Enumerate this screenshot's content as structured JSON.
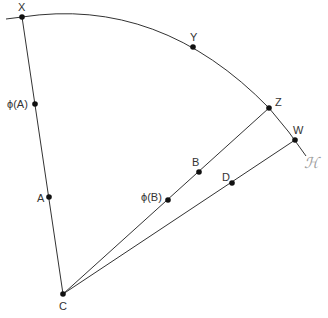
{
  "diagram": {
    "colors": {
      "line": "#333333",
      "point": "#111111",
      "label": "#333333",
      "script": "#9a9a9a"
    },
    "center": {
      "name": "C",
      "x": 63,
      "y": 294,
      "label": "C"
    },
    "arc": {
      "label": "ℋ",
      "description": "circular arc centered at C through X, Y, Z, W"
    },
    "points": [
      {
        "id": "X",
        "label": "X",
        "x": 22,
        "y": 17
      },
      {
        "id": "Y",
        "label": "Y",
        "x": 193,
        "y": 47
      },
      {
        "id": "Z",
        "label": "Z",
        "x": 269,
        "y": 108
      },
      {
        "id": "W",
        "label": "W",
        "x": 295,
        "y": 140
      },
      {
        "id": "phiA",
        "label": "ϕ(A)",
        "x": 35,
        "y": 104
      },
      {
        "id": "A",
        "label": "A",
        "x": 49,
        "y": 197
      },
      {
        "id": "B",
        "label": "B",
        "x": 199,
        "y": 172
      },
      {
        "id": "phiB",
        "label": "ϕ(B)",
        "x": 168,
        "y": 200
      },
      {
        "id": "D",
        "label": "D",
        "x": 232,
        "y": 183
      }
    ],
    "segments": [
      [
        "C",
        "X"
      ],
      [
        "C",
        "Z"
      ],
      [
        "C",
        "W"
      ]
    ]
  }
}
